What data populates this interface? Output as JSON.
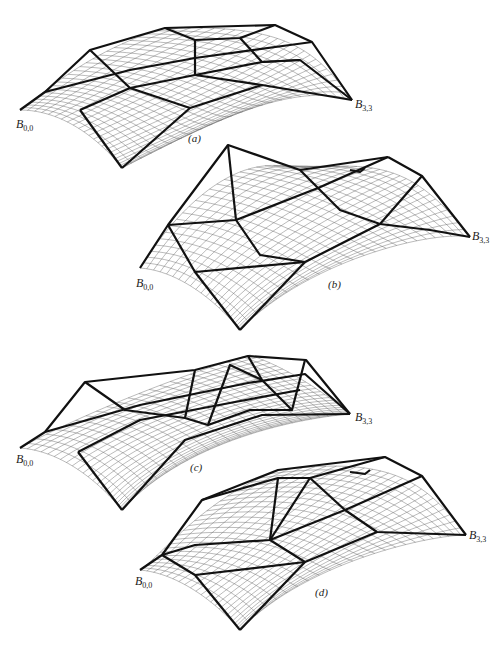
{
  "figure": {
    "panels": [
      {
        "id": "a",
        "caption": "(a)",
        "start_label": "B",
        "start_sub": "0,0",
        "end_label": "B",
        "end_sub": "3,3"
      },
      {
        "id": "b",
        "caption": "(b)",
        "start_label": "B",
        "start_sub": "0,0",
        "end_label": "B",
        "end_sub": "3,3"
      },
      {
        "id": "c",
        "caption": "(c)",
        "start_label": "B",
        "start_sub": "0,0",
        "end_label": "B",
        "end_sub": "3,3"
      },
      {
        "id": "d",
        "caption": "(d)",
        "start_label": "B",
        "start_sub": "0,0",
        "end_label": "B",
        "end_sub": "3,3"
      }
    ],
    "nets": {
      "a": [
        [
          [
            20,
            110
          ],
          [
            45,
            92
          ],
          [
            90,
            50
          ],
          [
            165,
            28
          ]
        ],
        [
          [
            80,
            110
          ],
          [
            130,
            88
          ],
          [
            195,
            65
          ],
          [
            275,
            25
          ]
        ],
        [
          [
            122,
            168
          ],
          [
            190,
            140
          ],
          [
            262,
            112
          ],
          [
            312,
            42
          ]
        ],
        [
          [
            122,
            168
          ],
          [
            200,
            128
          ],
          [
            290,
            80
          ],
          [
            352,
            100
          ]
        ]
      ],
      "b": [
        [
          [
            140,
            268
          ],
          [
            165,
            228
          ],
          [
            228,
            145
          ],
          [
            300,
            170
          ]
        ],
        [
          [
            195,
            272
          ],
          [
            238,
            225
          ],
          [
            318,
            188
          ],
          [
            388,
            157
          ]
        ],
        [
          [
            240,
            330
          ],
          [
            305,
            262
          ],
          [
            380,
            224
          ],
          [
            422,
            176
          ]
        ],
        [
          [
            240,
            330
          ],
          [
            305,
            262
          ],
          [
            430,
            230
          ],
          [
            470,
            237
          ]
        ]
      ],
      "c": [
        [
          [
            20,
            448
          ],
          [
            85,
            412
          ],
          [
            195,
            370
          ],
          [
            250,
            355
          ]
        ],
        [
          [
            78,
            452
          ],
          [
            140,
            415
          ],
          [
            248,
            383
          ],
          [
            305,
            374
          ]
        ],
        [
          [
            122,
            510
          ],
          [
            185,
            440
          ],
          [
            292,
            410
          ],
          [
            350,
            414
          ]
        ],
        [
          [
            122,
            510
          ],
          [
            185,
            440
          ],
          [
            300,
            418
          ],
          [
            350,
            414
          ]
        ]
      ],
      "d": [
        [
          [
            140,
            570
          ],
          [
            162,
            555
          ],
          [
            202,
            500
          ],
          [
            278,
            470
          ]
        ],
        [
          [
            195,
            575
          ],
          [
            270,
            540
          ],
          [
            310,
            478
          ],
          [
            385,
            457
          ]
        ],
        [
          [
            240,
            630
          ],
          [
            305,
            562
          ],
          [
            377,
            532
          ],
          [
            422,
            476
          ]
        ],
        [
          [
            240,
            630
          ],
          [
            305,
            562
          ],
          [
            430,
            535
          ],
          [
            466,
            535
          ]
        ]
      ]
    }
  }
}
